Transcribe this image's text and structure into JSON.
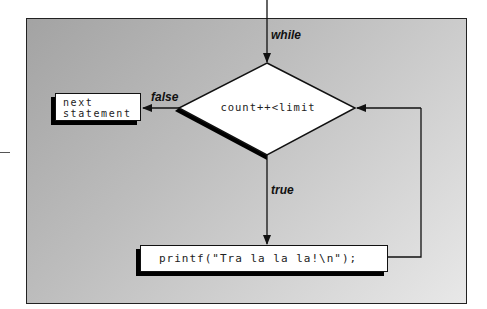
{
  "diagram": {
    "type": "flowchart",
    "entry_label": "while",
    "condition": "count++<limit",
    "false_label": "false",
    "true_label": "true",
    "false_target": "next\nstatement",
    "false_target_lines": [
      "next",
      "statement"
    ],
    "body_statement": "printf(\"Tra la la la!\\n\");",
    "loop_back": "body returns to condition"
  },
  "colors": {
    "background_gradient_start": "#a3a3a3",
    "background_gradient_end": "#e8e8e8",
    "box_fill": "#ffffff",
    "stroke": "#111111",
    "shadow": "#000000"
  }
}
